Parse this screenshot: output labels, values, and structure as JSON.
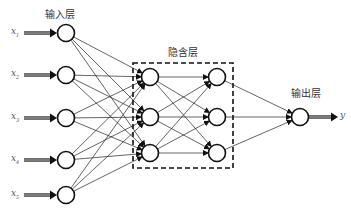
{
  "diagram": {
    "type": "neural-network",
    "layers": {
      "input": {
        "label": "输入层",
        "nodes": 5
      },
      "hidden": {
        "label": "隐含层",
        "columns": 2,
        "nodes_per_column": 3
      },
      "output": {
        "label": "输出层",
        "nodes": 1
      }
    },
    "inputs": [
      {
        "name": "x",
        "sub": "1"
      },
      {
        "name": "x",
        "sub": "2"
      },
      {
        "name": "x",
        "sub": "3"
      },
      {
        "name": "x",
        "sub": "4"
      },
      {
        "name": "x",
        "sub": "5"
      }
    ],
    "output_var": "y",
    "colors": {
      "stroke": "#111111",
      "background": "#ffffff",
      "text": "#333333"
    }
  }
}
